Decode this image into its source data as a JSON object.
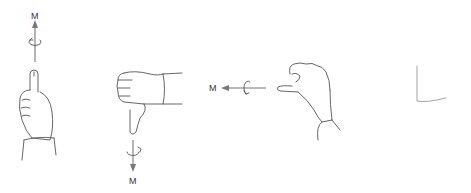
{
  "figure": {
    "panels": [
      {
        "id": "thumb-up",
        "moment_label": "M",
        "arrow_direction": "up"
      },
      {
        "id": "thumb-down",
        "moment_label": "M",
        "arrow_direction": "down"
      },
      {
        "id": "thumb-left",
        "moment_label": "M",
        "arrow_direction": "left"
      }
    ],
    "colors": {
      "line": "#555555",
      "arrow": "#777777",
      "background": "#ffffff"
    }
  }
}
